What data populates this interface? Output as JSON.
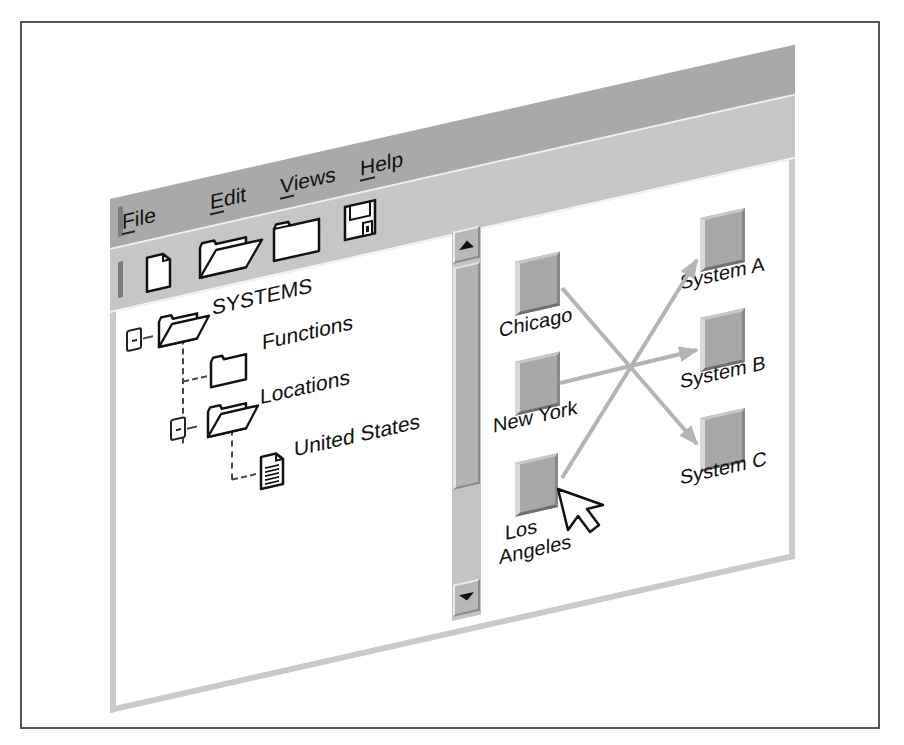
{
  "menu": {
    "items": [
      {
        "label": "File",
        "mnemonic": "F",
        "rest": "ile"
      },
      {
        "label": "Edit",
        "mnemonic": "E",
        "rest": "dit"
      },
      {
        "label": "Views",
        "mnemonic": "V",
        "rest": "iews"
      },
      {
        "label": "Help",
        "mnemonic": "H",
        "rest": "elp"
      }
    ]
  },
  "toolbar": {
    "buttons": [
      {
        "icon": "new-document-icon",
        "tooltip": ""
      },
      {
        "icon": "open-folder-icon",
        "tooltip": ""
      },
      {
        "icon": "closed-folder-icon",
        "tooltip": ""
      },
      {
        "icon": "save-disk-icon",
        "tooltip": ""
      }
    ]
  },
  "tree": {
    "root": {
      "label": "SYSTEMS",
      "expanded": true,
      "icon": "open-folder-icon"
    },
    "children": [
      {
        "label": "Functions",
        "expanded": false,
        "icon": "closed-folder-icon"
      },
      {
        "label": "Locations",
        "expanded": true,
        "icon": "open-folder-icon",
        "children": [
          {
            "label": "United States",
            "icon": "document-icon"
          }
        ]
      }
    ]
  },
  "diagram": {
    "sources": [
      {
        "label": "Chicago"
      },
      {
        "label": "New York"
      },
      {
        "label": "Los Angeles",
        "line1": "Los",
        "line2": "Angeles"
      }
    ],
    "targets": [
      {
        "label": "System A"
      },
      {
        "label": "System B"
      },
      {
        "label": "System C"
      }
    ],
    "connections": [
      {
        "from": "Chicago",
        "to": "System C"
      },
      {
        "from": "New York",
        "to": "System B"
      },
      {
        "from": "Los Angeles",
        "to": "System A"
      }
    ],
    "colors": {
      "arrow": "#b4b4b4",
      "node": "#a7a7a7"
    }
  },
  "cursor": {
    "over": "Los Angeles"
  }
}
